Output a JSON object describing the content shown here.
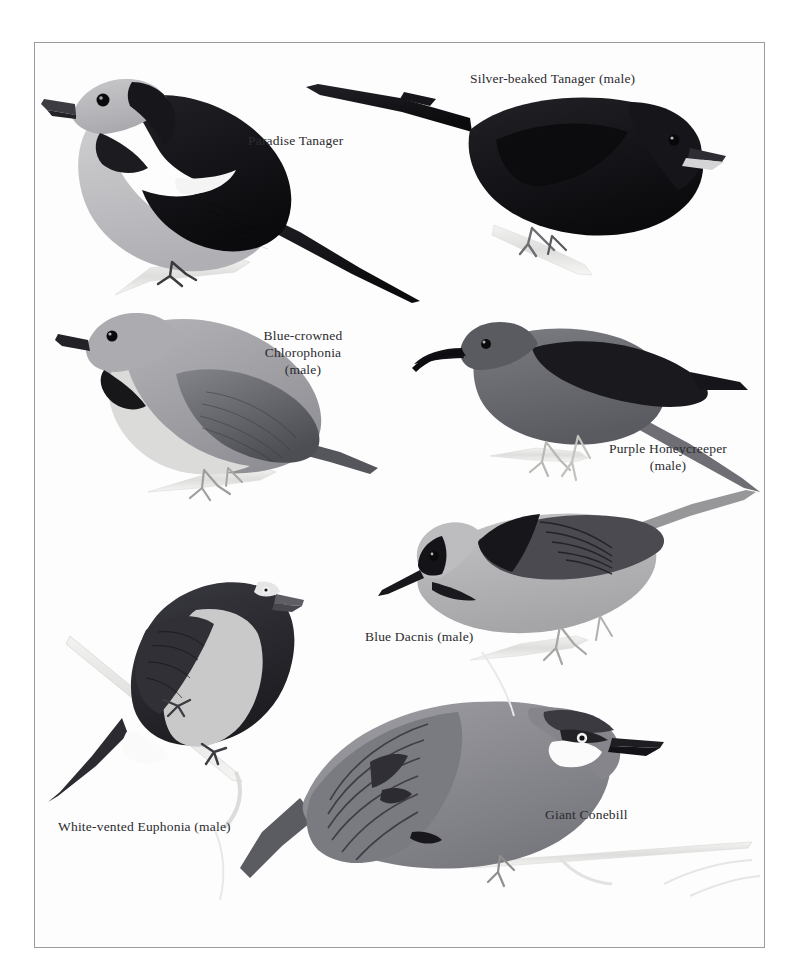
{
  "plate": {
    "title": "Tanagers and allies plate",
    "background_color": "#fdfdfd",
    "frame_color": "#9a9aa0",
    "page_color": "#ffffff",
    "medium": "grayscale field-guide illustration plate"
  },
  "labels": [
    {
      "id": "paradise-tanager",
      "text": "Paradise Tanager",
      "x": 248,
      "y": 132,
      "align": "left"
    },
    {
      "id": "silver-beaked-tanager",
      "text": "Silver-beaked Tanager (male)",
      "x": 470,
      "y": 70,
      "align": "left"
    },
    {
      "id": "blue-crowned-chlorophonia",
      "text": "Blue-crowned\nChlorophonia\n(male)",
      "x": 243,
      "y": 327,
      "align": "center",
      "width": 120
    },
    {
      "id": "purple-honeycreeper",
      "text": "Purple Honeycreeper\n(male)",
      "x": 603,
      "y": 440,
      "align": "center",
      "width": 130
    },
    {
      "id": "blue-dacnis",
      "text": "Blue Dacnis (male)",
      "x": 365,
      "y": 628,
      "align": "left"
    },
    {
      "id": "white-vented-euphonia",
      "text": "White-vented Euphonia (male)",
      "x": 58,
      "y": 818,
      "align": "left"
    },
    {
      "id": "giant-conebill",
      "text": "Giant Conebill",
      "x": 545,
      "y": 806,
      "align": "left"
    }
  ],
  "birds": [
    {
      "id": "paradise-tanager",
      "common_name": "Paradise Tanager",
      "sex": "",
      "facing": "left",
      "position": {
        "x": 42,
        "y": 62,
        "w": 385,
        "h": 250
      },
      "colors": {
        "crown": "#b9b9bc",
        "mask": "#16161a",
        "back": "#1c1c20",
        "wing": "#141418",
        "wing_patch": "#f2f2f2",
        "underparts": "#c3c3c6",
        "bill": "#3a3a40",
        "eye": "#0a0a0c",
        "tail": "#101014",
        "perch": "#dedede"
      }
    },
    {
      "id": "silver-beaked-tanager",
      "common_name": "Silver-beaked Tanager",
      "sex": "male",
      "facing": "right",
      "position": {
        "x": 300,
        "y": 82,
        "w": 410,
        "h": 195
      },
      "colors": {
        "body": "#101013",
        "head": "#17171b",
        "bill_upper": "#2c2c31",
        "bill_lower": "#d2d2d4",
        "eye": "#0a0a0c",
        "tail": "#0e0e11",
        "legs": "#7c7c80",
        "perch": "#e5e5e5"
      }
    },
    {
      "id": "blue-crowned-chlorophonia",
      "common_name": "Blue-crowned Chlorophonia",
      "sex": "male",
      "facing": "left",
      "position": {
        "x": 48,
        "y": 310,
        "w": 350,
        "h": 200
      },
      "colors": {
        "head": "#a9a9ad",
        "back": "#9a9a9f",
        "wing": "#6e6e74",
        "wing_dark": "#4b4b51",
        "throat_band": "#17171a",
        "underparts": "#d8d8d6",
        "bill": "#232327",
        "eye": "#0a0a0c",
        "legs": "#b4b4b2",
        "perch": "#e3e3e1"
      }
    },
    {
      "id": "purple-honeycreeper",
      "common_name": "Purple Honeycreeper",
      "sex": "male",
      "facing": "left",
      "position": {
        "x": 430,
        "y": 322,
        "w": 330,
        "h": 180
      },
      "colors": {
        "body": "#6a6a70",
        "head": "#5e5e65",
        "wing": "#1a1a1e",
        "bill": "#121216",
        "eye": "#0b0b0d",
        "legs": "#cfcfcb",
        "perch": "#e6e6e4"
      }
    },
    {
      "id": "blue-dacnis",
      "common_name": "Blue Dacnis",
      "sex": "male",
      "facing": "left",
      "position": {
        "x": 380,
        "y": 485,
        "w": 375,
        "h": 185
      },
      "colors": {
        "body": "#b5b5b7",
        "mask": "#141418",
        "back_streaks": "#1e1e22",
        "wing": "#45454b",
        "bill": "#18181c",
        "eye": "#0a0a0c",
        "legs": "#bdbdbb",
        "perch": "#e4e4e2"
      }
    },
    {
      "id": "white-vented-euphonia",
      "common_name": "White-vented Euphonia",
      "sex": "male",
      "facing": "right",
      "position": {
        "x": 62,
        "y": 560,
        "w": 230,
        "h": 230
      },
      "colors": {
        "head": "#242428",
        "back": "#303036",
        "wing": "#2a2a30",
        "underparts": "#c9c9c9",
        "vent": "#fbfbfb",
        "bill": "#5a5a60",
        "eye": "#efefef",
        "legs": "#4a4a50",
        "twig": "#dcdcda"
      }
    },
    {
      "id": "giant-conebill",
      "common_name": "Giant Conebill",
      "sex": "",
      "facing": "right",
      "position": {
        "x": 238,
        "y": 695,
        "w": 410,
        "h": 190
      },
      "colors": {
        "body": "#8c8c92",
        "back": "#6f6f76",
        "wing_bars": "#3c3c42",
        "cheek_patch": "#fcfcfc",
        "crown": "#3a3a40",
        "eyeline": "#232327",
        "bill": "#1a1a1e",
        "eye": "#101014",
        "legs": "#9d9d9b",
        "perch": "#e8e8e6"
      }
    }
  ]
}
